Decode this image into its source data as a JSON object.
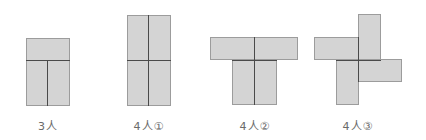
{
  "diagram": {
    "colors": {
      "fill": "#d4d4d4",
      "border": "#9c9c9c",
      "divider": "#4a4a4a",
      "label": "#6a6a6a"
    },
    "figures": [
      {
        "id": "3-person",
        "label": "3人"
      },
      {
        "id": "4-person-1",
        "label": "4人①"
      },
      {
        "id": "4-person-2",
        "label": "4人②"
      },
      {
        "id": "4-person-3",
        "label": "4人③"
      }
    ]
  }
}
